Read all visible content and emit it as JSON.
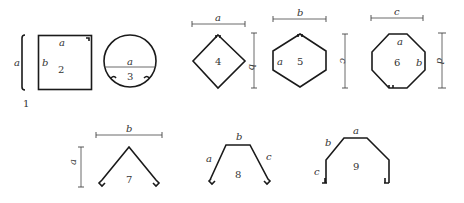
{
  "figure": {
    "shapes": [
      {
        "id": "1",
        "number": "1",
        "kind": "flat-strip",
        "labels": {
          "side": "a"
        }
      },
      {
        "id": "2",
        "number": "2",
        "kind": "rectangle",
        "labels": {
          "top": "a",
          "left": "b"
        }
      },
      {
        "id": "3",
        "number": "3",
        "kind": "circle",
        "labels": {
          "diameter": "a"
        }
      },
      {
        "id": "4",
        "number": "4",
        "kind": "diamond",
        "labels": {
          "width": "a",
          "height": "b"
        }
      },
      {
        "id": "5",
        "number": "5",
        "kind": "hexagon",
        "labels": {
          "side": "a",
          "width": "b",
          "height": "c"
        }
      },
      {
        "id": "6",
        "number": "6",
        "kind": "octagon",
        "labels": {
          "top": "a",
          "side": "b",
          "width": "c",
          "height": "d"
        }
      },
      {
        "id": "7",
        "number": "7",
        "kind": "ridge",
        "labels": {
          "height": "a",
          "width": "b"
        }
      },
      {
        "id": "8",
        "number": "8",
        "kind": "trapezoid-channel",
        "labels": {
          "left": "a",
          "top": "b",
          "right": "c"
        }
      },
      {
        "id": "9",
        "number": "9",
        "kind": "hat-channel",
        "labels": {
          "top": "a",
          "slope": "b",
          "leg": "c"
        }
      }
    ]
  }
}
